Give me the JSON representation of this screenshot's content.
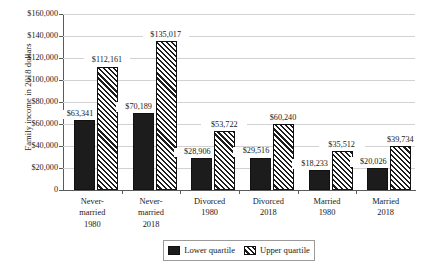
{
  "chart_data": {
    "type": "bar",
    "title": "",
    "xlabel": "",
    "ylabel": "Family income in 2018 dollars",
    "ylim": [
      0,
      160000
    ],
    "grid": true,
    "legend_position": "bottom",
    "categories": [
      {
        "line1": "Never-",
        "line2": "married",
        "line3": "1980"
      },
      {
        "line1": "Never-",
        "line2": "married",
        "line3": "2018"
      },
      {
        "line1": "Divorced",
        "line2": "1980",
        "line3": ""
      },
      {
        "line1": "Divorced",
        "line2": "2018",
        "line3": ""
      },
      {
        "line1": "Married",
        "line2": "1980",
        "line3": ""
      },
      {
        "line1": "Married",
        "line2": "2018",
        "line3": ""
      }
    ],
    "series": [
      {
        "name": "Lower quartile",
        "values": [
          63341,
          70189,
          28906,
          29516,
          18233,
          20026
        ],
        "labels": [
          "$63,341",
          "$70,189",
          "$28,906",
          "$29,516",
          "$18,233",
          "$20,026"
        ],
        "color": "#1c1c1c",
        "pattern": "solid"
      },
      {
        "name": "Upper quartile",
        "values": [
          112161,
          135017,
          53722,
          60240,
          35512,
          39734
        ],
        "labels": [
          "$112,161",
          "$135,017",
          "$53,722",
          "$60,240",
          "$35,512",
          "$39,734"
        ],
        "color": "#1c1c1c",
        "pattern": "diagonal-hatch"
      }
    ],
    "y_ticks": [
      {
        "value": 160000,
        "label": "$160,000"
      },
      {
        "value": 140000,
        "label": "$140,000"
      },
      {
        "value": 120000,
        "label": "$120,000"
      },
      {
        "value": 100000,
        "label": "$100,000"
      },
      {
        "value": 80000,
        "label": "$80,000"
      },
      {
        "value": 60000,
        "label": "$60,000"
      },
      {
        "value": 40000,
        "label": "$40,000"
      },
      {
        "value": 20000,
        "label": "$20,000"
      },
      {
        "value": 0,
        "label": "0"
      }
    ]
  },
  "legend": {
    "items": [
      {
        "label": "Lower quartile"
      },
      {
        "label": "Upper quartile"
      }
    ]
  }
}
